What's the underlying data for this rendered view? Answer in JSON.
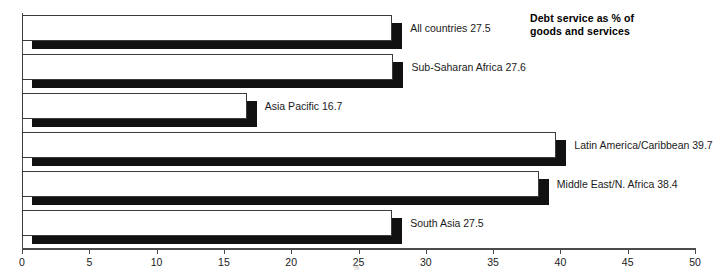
{
  "chart_data": {
    "type": "bar",
    "orientation": "horizontal",
    "title": "Debt service as % of goods and services",
    "title_lines": [
      "Debt service as % of",
      "goods and services"
    ],
    "xlabel": "%",
    "ylabel": "",
    "xlim": [
      0,
      50
    ],
    "xticks": [
      0,
      5,
      10,
      15,
      20,
      25,
      30,
      35,
      40,
      45,
      50
    ],
    "xtick_labels": [
      "0",
      "5",
      "10",
      "15",
      "20",
      "25",
      "30",
      "35",
      "40",
      "45",
      "50"
    ],
    "grid": false,
    "legend": "none",
    "style": "3d-block-bars-white-face-black-shadow",
    "categories": [
      "All countries",
      "Sub-Saharan Africa",
      "Asia Pacific",
      "Latin America/Caribbean",
      "Middle East/N. Africa",
      "South Asia"
    ],
    "values": [
      27.5,
      27.6,
      16.7,
      39.7,
      38.4,
      27.5
    ],
    "data_labels": [
      "All countries 27.5",
      "Sub-Saharan Africa 27.6",
      "Asia Pacific 16.7",
      "Latin America/Caribbean 39.7",
      "Middle East/N. Africa 38.4",
      "South Asia 27.5"
    ]
  },
  "colors": {
    "bar_face": "#ffffff",
    "bar_shadow": "#111111",
    "bar_outline": "#3c3c3c",
    "axis": "#4a4a4a",
    "text": "#1a1a1a",
    "background": "#ffffff"
  }
}
